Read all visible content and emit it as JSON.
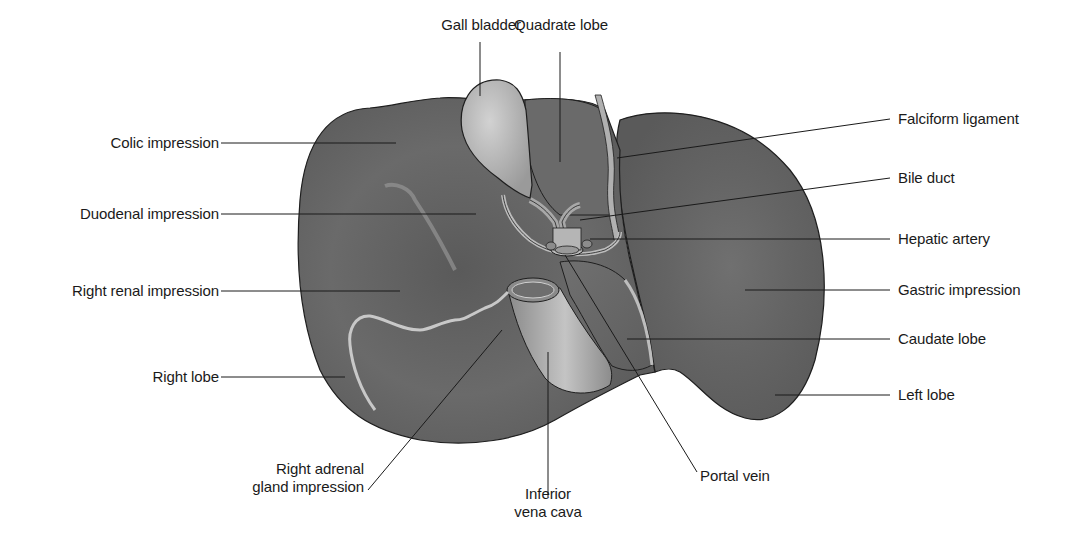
{
  "labels": {
    "gall_bladder": "Gall bladder",
    "quadrate_lobe": "Quadrate lobe",
    "colic_impression": "Colic impression",
    "duodenal_impression": "Duodenal impression",
    "right_renal_impression": "Right renal impression",
    "right_lobe": "Right lobe",
    "right_adrenal_line1": "Right adrenal",
    "right_adrenal_line2": "gland impression",
    "ivc_line1": "Inferior",
    "ivc_line2": "vena cava",
    "portal_vein": "Portal vein",
    "falciform_ligament": "Falciform ligament",
    "bile_duct": "Bile duct",
    "hepatic_artery": "Hepatic artery",
    "gastric_impression": "Gastric impression",
    "caudate_lobe": "Caudate lobe",
    "left_lobe": "Left lobe"
  },
  "colors": {
    "liver_fill": "#6e6e6e",
    "liver_dark": "#555555",
    "gallbladder_fill": "#b8b8b8",
    "vessel_fill": "#a9a9a9",
    "ligament_fill": "#b0b0b0",
    "outline": "#1e1e1e",
    "leader_line": "#1a1a1a",
    "text": "#1a1a1a",
    "background": "#ffffff"
  }
}
